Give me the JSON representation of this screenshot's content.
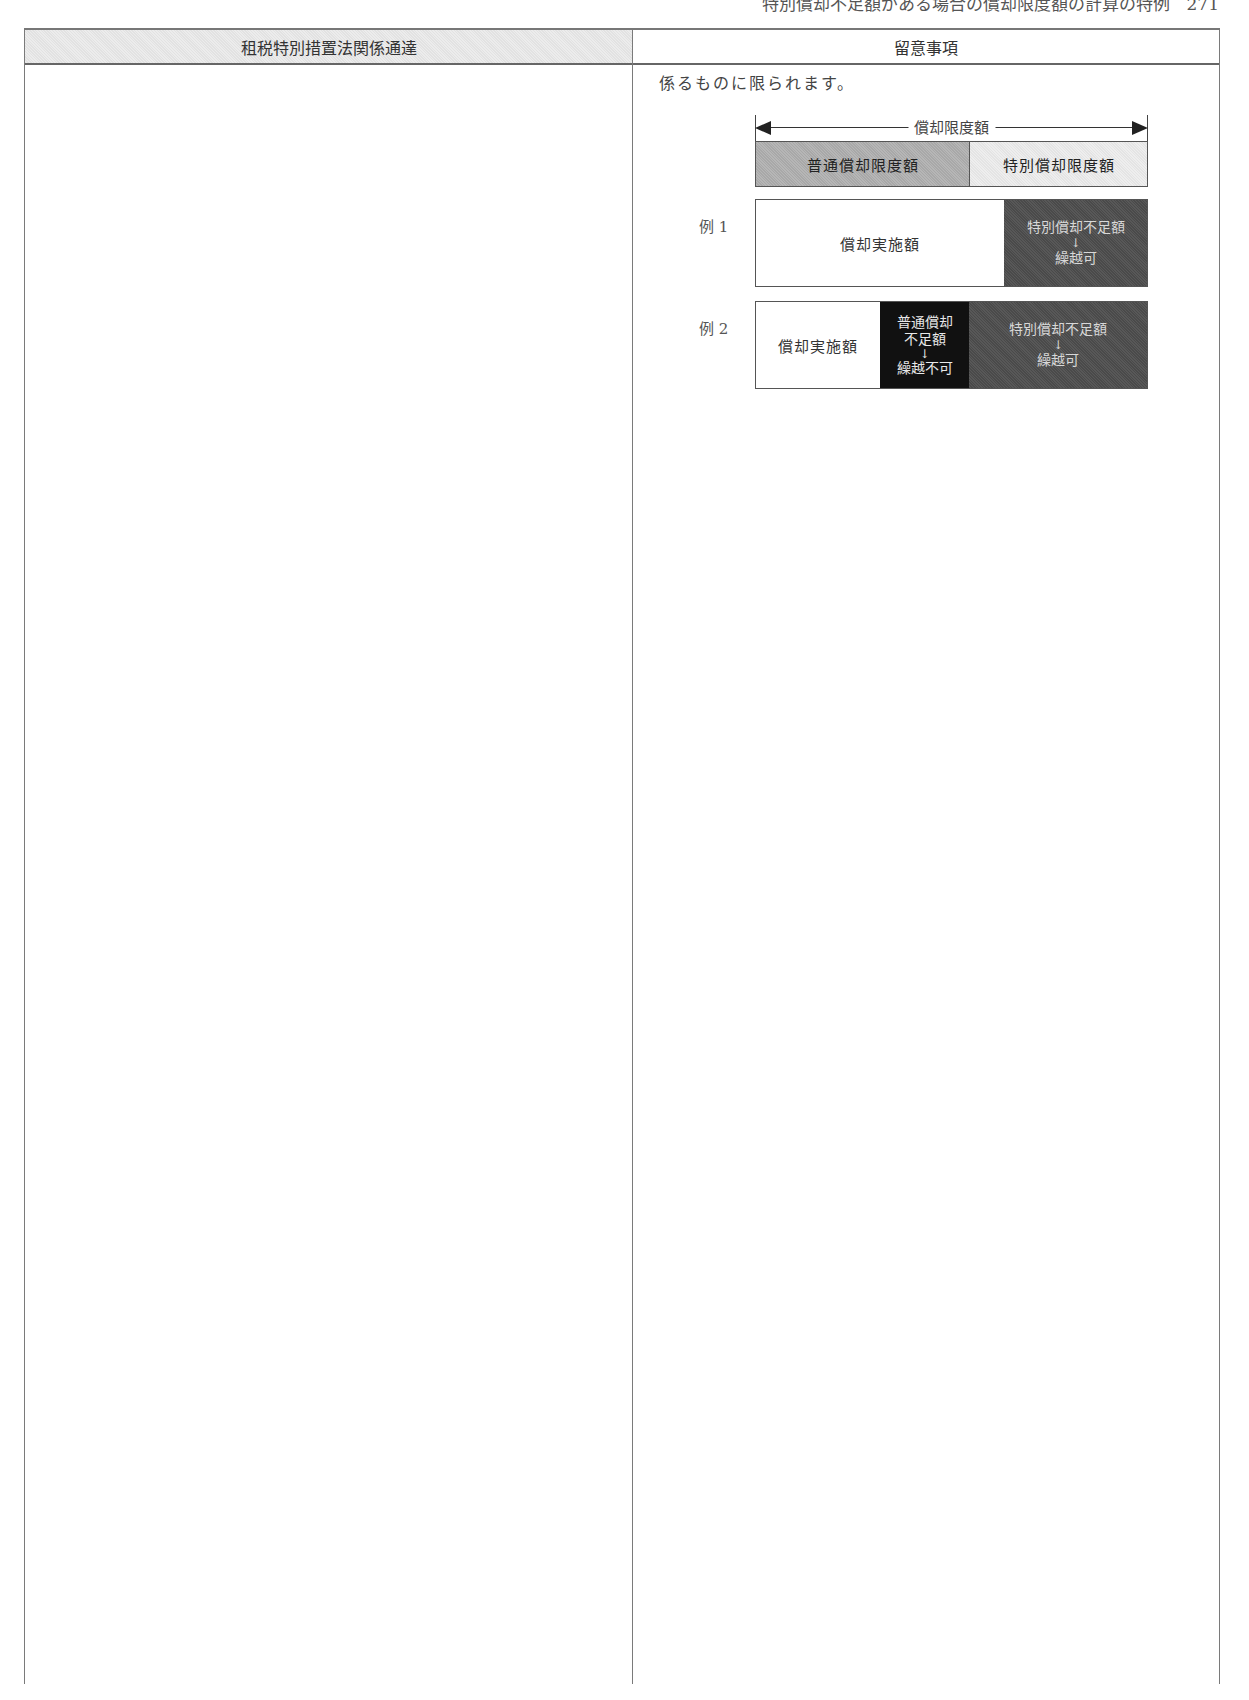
{
  "running_header": "特別償却不足額がある場合の償却限度額の計算の特例　271",
  "table": {
    "headers": {
      "left": "租税特別措置法関係通達",
      "right": "留意事項"
    },
    "left_column": {
      "content": ""
    },
    "right_column": {
      "note_text": "係るものに限られます。",
      "diagram": {
        "range_label": "償却限度額",
        "limit_segments": {
          "normal": "普通償却限度額",
          "special": "特別償却限度額"
        },
        "examples": [
          {
            "label": "例 1",
            "segments": [
              {
                "type": "white",
                "text": "償却実施額"
              },
              {
                "type": "dark",
                "line1": "特別償却不足額",
                "arrow": "↓",
                "line2": "繰越可"
              }
            ]
          },
          {
            "label": "例 2",
            "segments": [
              {
                "type": "white",
                "text": "償却実施額"
              },
              {
                "type": "black",
                "line1": "普通償却",
                "line2": "不足額",
                "arrow": "↓",
                "line3": "繰越不可"
              },
              {
                "type": "dark",
                "line1": "特別償却不足額",
                "arrow": "↓",
                "line2": "繰越可"
              }
            ]
          }
        ]
      }
    }
  },
  "colors": {
    "header_shade": "#e6e6e6",
    "normal_limit_fill": "#b0b0b0",
    "special_limit_fill": "#eaeaea",
    "shortfall_dark": "#505050",
    "shortfall_black": "#111111"
  }
}
